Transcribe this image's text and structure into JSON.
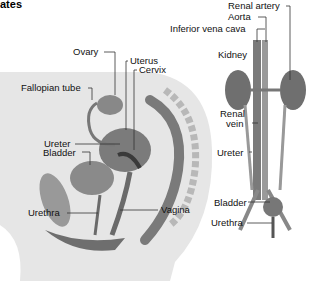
{
  "header": {
    "title_fragment": "ates"
  },
  "female_diagram": {
    "labels": {
      "ovary": "Ovary",
      "uterus": "Uterus",
      "cervix": "Cervix",
      "fallopian_tube": "Fallopian tube",
      "ureter": "Ureter",
      "bladder": "Bladder",
      "urethra": "Urethra",
      "vagina": "Vagina"
    }
  },
  "urinary_diagram": {
    "labels": {
      "renal_artery": "Renal artery",
      "aorta": "Aorta",
      "inferior_vena_cava": "Inferior vena cava",
      "kidney": "Kidney",
      "renal_vein_line1": "Renal",
      "renal_vein_line2": "vein",
      "ureter": "Ureter",
      "bladder": "Bladder",
      "urethra": "Urethra"
    }
  },
  "colors": {
    "background": "#ffffff",
    "body_silhouette": "#e4e4e4",
    "organ_dark": "#6a6a6a",
    "organ_mid": "#8c8c8c",
    "leader_line": "#333333"
  }
}
